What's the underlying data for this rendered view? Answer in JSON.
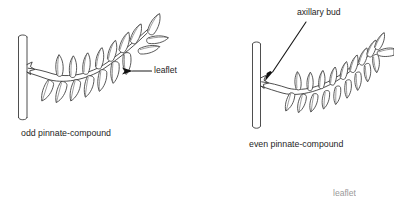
{
  "figure": {
    "background_color": "#ffffff",
    "ink_color": "#3b3b3b",
    "arrow_color": "#111111"
  },
  "diagrams": [
    {
      "id": "odd-pinnate",
      "caption": "odd pinnate-compound",
      "description": "Compound leaf with paired lateral leaflets and a single terminal leaflet at the rachis tip",
      "leaflet_pairs": 7,
      "has_terminal_leaflet": true,
      "labels": [
        {
          "name": "leaflet",
          "text": "leaflet",
          "arrow": "horizontal-left-pointing"
        }
      ]
    },
    {
      "id": "even-pinnate",
      "caption": "even pinnate-compound",
      "description": "Compound leaf with paired lateral leaflets ending in a pair, no terminal leaflet",
      "leaflet_pairs": 9,
      "has_terminal_leaflet": false,
      "labels": [
        {
          "name": "axillary bud",
          "text": "axillary bud",
          "arrow": "diagonal-down-left-pointing"
        }
      ]
    }
  ],
  "cutoff_text": {
    "partial_label": "leaflet"
  }
}
